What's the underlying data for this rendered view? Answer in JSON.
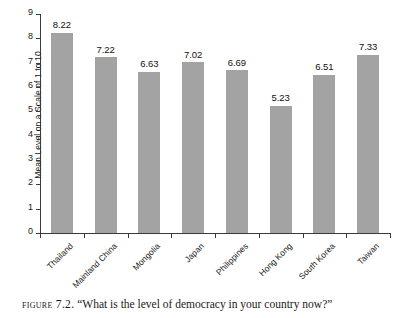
{
  "chart_data": {
    "type": "bar",
    "title": "",
    "xlabel": "",
    "ylabel": "Mean Level on a Scale of 1 to 10",
    "ylim": [
      0,
      9
    ],
    "yticks": [
      0,
      1,
      2,
      3,
      4,
      5,
      6,
      7,
      8,
      9
    ],
    "grid": false,
    "legend": false,
    "bar_color": "#a3a3a3",
    "categories": [
      "Thailand",
      "Mainland China",
      "Mongolia",
      "Japan",
      "Philippines",
      "Hong Kong",
      "South Korea",
      "Taiwan"
    ],
    "values": [
      8.22,
      7.22,
      6.63,
      7.02,
      6.69,
      5.23,
      6.51,
      7.33
    ],
    "value_labels": [
      "8.22",
      "7.22",
      "6.63",
      "7.02",
      "6.69",
      "5.23",
      "6.51",
      "7.33"
    ]
  },
  "caption": {
    "figure_number": "Figure 7.2.",
    "text": "“What is the level of democracy in your country now?”"
  }
}
